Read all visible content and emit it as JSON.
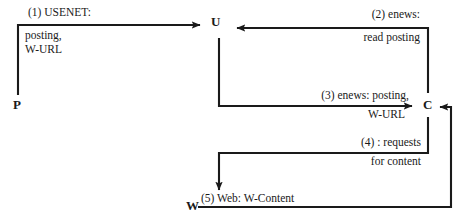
{
  "diagram": {
    "type": "flow-sequence-diagram",
    "background_color": "#ffffff",
    "stroke_color": "#1a1a1a",
    "nodes": [
      {
        "id": "P",
        "label": "P",
        "x": 13,
        "y": 98
      },
      {
        "id": "U",
        "label": "U",
        "x": 211,
        "y": 15
      },
      {
        "id": "C",
        "label": "C",
        "x": 423,
        "y": 98
      },
      {
        "id": "W",
        "label": "W",
        "x": 186,
        "y": 199
      }
    ],
    "edges": [
      {
        "id": "edge-1",
        "from": "P",
        "to": "U",
        "number": "(1)",
        "line1": "(1) USENET:",
        "line2": "posting,",
        "line3": "W-URL",
        "direction": "up-right"
      },
      {
        "id": "edge-2",
        "from": "C",
        "to": "U",
        "number": "(2)",
        "line1": "(2) enews:",
        "line2": "read posting",
        "direction": "up-left"
      },
      {
        "id": "edge-3",
        "from": "U",
        "to": "C",
        "number": "(3)",
        "line1": "(3) enews: posting,",
        "line2": "W-URL",
        "direction": "down-right"
      },
      {
        "id": "edge-4",
        "from": "C",
        "to": "W",
        "number": "(4)",
        "line1": "(4) : requests",
        "line2": "for content",
        "direction": "left-down"
      },
      {
        "id": "edge-5",
        "from": "W",
        "to": "C",
        "number": "(5)",
        "line1": "(5) Web: W-Content",
        "direction": "right-up"
      }
    ]
  }
}
